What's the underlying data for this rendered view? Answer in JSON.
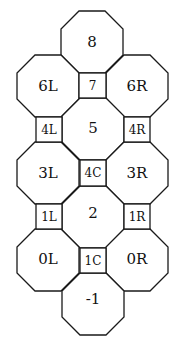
{
  "diagram": {
    "title": "",
    "stroke_color": "#1a1a1a",
    "background": "#ffffff",
    "octagons": [
      {
        "id": "8",
        "label": "8"
      },
      {
        "id": "6L",
        "label": "6L"
      },
      {
        "id": "6R",
        "label": "6R"
      },
      {
        "id": "5",
        "label": "5"
      },
      {
        "id": "3L",
        "label": "3L"
      },
      {
        "id": "3R",
        "label": "3R"
      },
      {
        "id": "2",
        "label": "2"
      },
      {
        "id": "0L",
        "label": "0L"
      },
      {
        "id": "0R",
        "label": "0R"
      },
      {
        "id": "-1",
        "label": "-1"
      }
    ],
    "squares": [
      {
        "id": "7",
        "label": "7"
      },
      {
        "id": "4L",
        "label": "4L"
      },
      {
        "id": "4R",
        "label": "4R"
      },
      {
        "id": "4C",
        "label": "4C"
      },
      {
        "id": "1L",
        "label": "1L"
      },
      {
        "id": "1R",
        "label": "1R"
      },
      {
        "id": "1C",
        "label": "1C"
      }
    ]
  }
}
